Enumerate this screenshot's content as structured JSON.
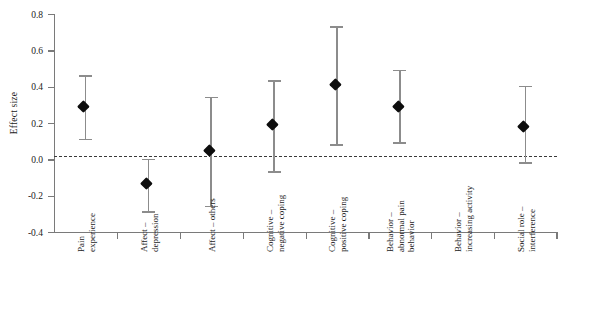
{
  "chart_data": {
    "type": "scatter",
    "title": "",
    "xlabel": "",
    "ylabel": "Effect size",
    "ylim": [
      -0.4,
      0.8
    ],
    "ytick_values": [
      0.8,
      0.6,
      0.4,
      0.2,
      0.0,
      -0.2,
      -0.4
    ],
    "ytick_labels": [
      "0.8",
      "0.6",
      "0.4",
      "0.2",
      "0.0",
      "-0.2",
      "-0.4"
    ],
    "grid": false,
    "legend": "none",
    "reference_line": {
      "value": 0.02,
      "style": "dashed",
      "color": "#3a3a3a"
    },
    "categories": [
      "Pain experience",
      "Affect – depression",
      "Affect – others",
      "Cognitive – negative coping",
      "Cognitive – positive coping",
      "Behavior – abnormal pain behavior",
      "Behavior – increasing activity",
      "Social role – interference"
    ],
    "category_lines": [
      [
        "Pain",
        "experience"
      ],
      [
        "Affect –",
        "depression"
      ],
      [
        "Affect – others"
      ],
      [
        "Cognitive –",
        "negative coping"
      ],
      [
        "Cognitive –",
        "positive coping"
      ],
      [
        "Behavior –",
        "abnormal pain",
        "behavior"
      ],
      [
        "Behavior –",
        "increasing activity"
      ],
      [
        "Social role –",
        "interference"
      ]
    ],
    "values": [
      0.29,
      -0.13,
      0.05,
      0.19,
      0.41,
      0.29,
      null,
      0.18
    ],
    "ci_lower": [
      0.11,
      -0.29,
      -0.26,
      -0.07,
      0.08,
      0.09,
      null,
      -0.02
    ],
    "ci_upper": [
      0.46,
      0.0,
      0.34,
      0.43,
      0.73,
      0.49,
      null,
      0.4
    ],
    "marker": "filled-diamond",
    "marker_color": "#0d0d0d",
    "errorbar_color": "#8c8c8c",
    "axis_color": "#7a7a7a"
  }
}
